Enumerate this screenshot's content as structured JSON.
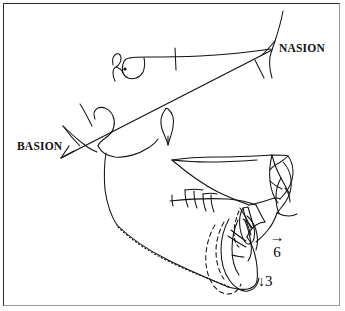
{
  "figure": {
    "kind": "lateral-cephalometric-tracing",
    "background_color": "#ffffff",
    "ink_color": "#121212",
    "frame": {
      "border_dark": "#2b2b2b",
      "border_light": "#9a9a9a"
    }
  },
  "labels": {
    "nasion": "NASION",
    "basion": "BASION"
  },
  "annotations": {
    "horizontal": {
      "arrow": "→",
      "value": "6"
    },
    "vertical": {
      "arrow": "↓",
      "value": "3"
    }
  }
}
